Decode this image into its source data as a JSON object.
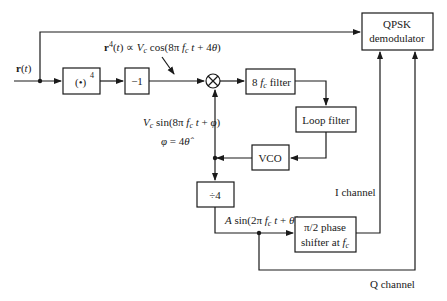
{
  "diagram": {
    "type": "block-diagram",
    "input": {
      "label": "r(t)"
    },
    "blocks": [
      {
        "id": "power4",
        "label": "(•)⁴"
      },
      {
        "id": "neg1",
        "label": "−1"
      },
      {
        "id": "mixer",
        "label": "⊗"
      },
      {
        "id": "filter8fc",
        "label": "8 fc filter"
      },
      {
        "id": "loop_filter",
        "label": "Loop filter"
      },
      {
        "id": "vco",
        "label": "VCO"
      },
      {
        "id": "div4",
        "label": "÷4"
      },
      {
        "id": "phase_shifter",
        "label_line1": "π/2 phase",
        "label_line2": "shifter at fc"
      },
      {
        "id": "qpsk",
        "label_line1": "QPSK",
        "label_line2": "demodulator"
      }
    ],
    "annotations": {
      "r4": "r⁴(t) ∝ Vc cos(8π fc t + 4θ)",
      "vco_out": "Vc sin(8π fc t + φ)",
      "phi": "φ = 4θ̂",
      "div_out": "A sin(2π fc t + θ̂)",
      "i_channel": "I channel",
      "q_channel": "Q channel"
    },
    "connections": [
      [
        "input",
        "power4"
      ],
      [
        "input",
        "qpsk"
      ],
      [
        "power4",
        "neg1"
      ],
      [
        "neg1",
        "mixer"
      ],
      [
        "mixer",
        "filter8fc"
      ],
      [
        "filter8fc",
        "loop_filter"
      ],
      [
        "loop_filter",
        "vco"
      ],
      [
        "vco",
        "mixer"
      ],
      [
        "vco",
        "div4"
      ],
      [
        "div4",
        "phase_shifter"
      ],
      [
        "phase_shifter",
        "qpsk"
      ],
      [
        "div4",
        "qpsk"
      ]
    ]
  }
}
